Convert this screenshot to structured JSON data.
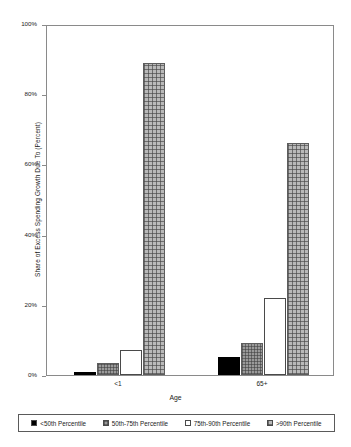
{
  "chart_data": {
    "type": "bar",
    "title": "",
    "xlabel": "Age",
    "ylabel": "Share of Excess Spending Growth Due To (Percent)",
    "categories": [
      "<1",
      "65+"
    ],
    "ylim": [
      0,
      100
    ],
    "ytick_labels": [
      "0%",
      "20%",
      "40%",
      "60%",
      "80%",
      "100%"
    ],
    "ytick_values": [
      0,
      20,
      40,
      60,
      80,
      100
    ],
    "grid": false,
    "legend_position": "bottom",
    "series": [
      {
        "name": "<50th Percentile",
        "swatch": "solid-black",
        "color": "#000000",
        "values": [
          1,
          5
        ]
      },
      {
        "name": "50th-75th Percentile",
        "swatch": "dense-grid-gray",
        "color": "#9a9a9a",
        "values": [
          3.5,
          9
        ]
      },
      {
        "name": "75th-90th Percentile",
        "swatch": "open-white",
        "color": "#ffffff",
        "values": [
          7,
          22
        ]
      },
      {
        "name": ">90th Percentile",
        "swatch": "grid-light-gray",
        "color": "#b9b9b9",
        "values": [
          89,
          66
        ]
      }
    ]
  }
}
